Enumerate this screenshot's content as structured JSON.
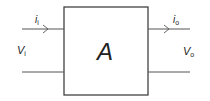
{
  "diagram": {
    "block_label": "A",
    "input_current": {
      "symbol": "i",
      "subscript": "i"
    },
    "input_voltage": {
      "symbol": "V",
      "subscript": "i"
    },
    "output_current": {
      "symbol": "i",
      "subscript": "o"
    },
    "output_voltage": {
      "symbol": "V",
      "subscript": "o"
    },
    "colors": {
      "stroke": "#333333",
      "text": "#222222",
      "background": "#ffffff"
    }
  }
}
